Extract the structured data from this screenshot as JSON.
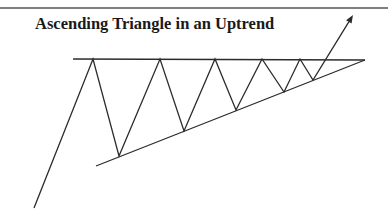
{
  "diagram": {
    "title": "Ascending Triangle in an Uptrend",
    "colors": {
      "line": "#2b2b2b",
      "background": "#ffffff",
      "border": "#555555"
    },
    "top_border": {
      "y": 8,
      "x1": 0,
      "x2": 388
    },
    "resistance_line": {
      "x1": 73,
      "y1": 59,
      "x2": 365,
      "y2": 60
    },
    "support_line": {
      "x1": 96,
      "y1": 166,
      "x2": 365,
      "y2": 60
    },
    "price_path": [
      [
        34,
        208
      ],
      [
        93,
        59
      ],
      [
        119,
        156
      ],
      [
        160,
        59
      ],
      [
        184,
        131
      ],
      [
        215,
        59
      ],
      [
        236,
        110
      ],
      [
        262,
        59
      ],
      [
        284,
        92
      ],
      [
        300,
        59
      ],
      [
        313,
        80
      ],
      [
        353,
        15
      ]
    ],
    "breakout_arrow": {
      "tip": [
        353,
        15
      ],
      "label": ""
    }
  }
}
